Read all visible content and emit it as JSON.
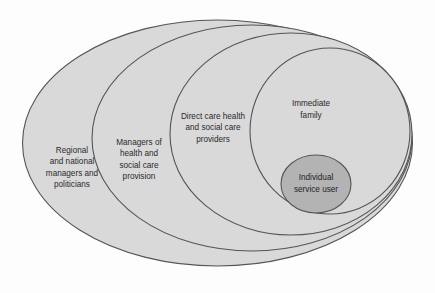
{
  "diagram": {
    "type": "concentric-ellipses",
    "background_color": "#fdfdfd",
    "ring_fill_color": "#d9d9d9",
    "core_fill_color": "#b3b3b3",
    "border_color": "#555558",
    "rings": [
      {
        "id": "regional-national",
        "label_lines": [
          "Regional",
          "and national",
          "managers and",
          "politicians"
        ],
        "level": 5,
        "label_x": 72,
        "label_y": 168,
        "cx": 217.5,
        "cy": 143,
        "rx": 195,
        "ry": 123,
        "fill": "#d9d9d9"
      },
      {
        "id": "managers-health-social",
        "label_lines": [
          "Managers of",
          "health and",
          "social care",
          "provision"
        ],
        "level": 4,
        "label_x": 139,
        "label_y": 160,
        "cx": 252,
        "cy": 138,
        "rx": 160,
        "ry": 113,
        "fill": "#d9d9d9"
      },
      {
        "id": "direct-care-providers",
        "label_lines": [
          "Direct care health",
          "and social care",
          "providers"
        ],
        "level": 3,
        "label_x": 213,
        "label_y": 128,
        "cx": 291,
        "cy": 134,
        "rx": 121,
        "ry": 101,
        "fill": "#d9d9d9"
      },
      {
        "id": "immediate-family",
        "label_lines": [
          "Immediate",
          "family"
        ],
        "level": 2,
        "label_x": 311,
        "label_y": 110,
        "cx": 330,
        "cy": 131,
        "rx": 80,
        "ry": 83,
        "fill": "#d9d9d9"
      },
      {
        "id": "individual-service-user",
        "label_lines": [
          "Individual",
          "service user"
        ],
        "level": 1,
        "label_x": 316,
        "label_y": 184,
        "cx": 316,
        "cy": 184,
        "rx": 35,
        "ry": 29,
        "fill": "#b3b3b3"
      }
    ]
  }
}
